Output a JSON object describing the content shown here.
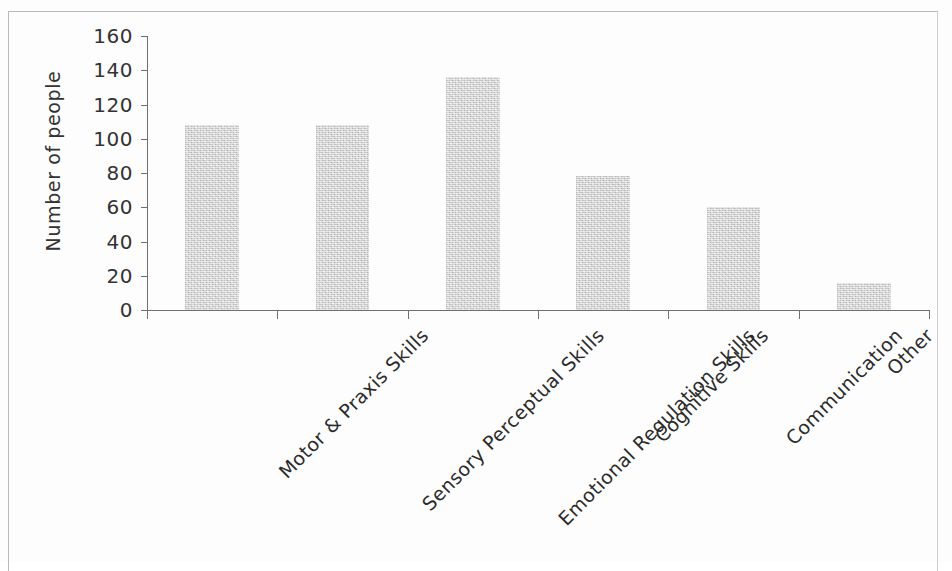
{
  "chart_data": {
    "type": "bar",
    "title": "",
    "subtitle": "",
    "xlabel": "",
    "ylabel": "Number of people",
    "ylim": [
      0,
      160
    ],
    "ytick_step": 20,
    "yticks": [
      160,
      140,
      120,
      100,
      80,
      60,
      40,
      20,
      0
    ],
    "ytick_labels": [
      "160",
      "140",
      "120",
      "100",
      "80",
      "60",
      "40",
      "20",
      "0"
    ],
    "grid": false,
    "legend": false,
    "legend_position": "none",
    "bar_color": "#c9c9c9",
    "axis_color": "#6f6f6f",
    "categories": [
      "Motor & Praxis Skills",
      "Sensory Perceptual Skills",
      "Emotional Regulation Skills",
      "Cognitive Skills",
      "Communication",
      "Other"
    ],
    "values": [
      108,
      108,
      136,
      78,
      60,
      16
    ],
    "series": [
      {
        "name": "Number of people",
        "values": [
          108,
          108,
          136,
          78,
          60,
          16
        ]
      }
    ]
  }
}
